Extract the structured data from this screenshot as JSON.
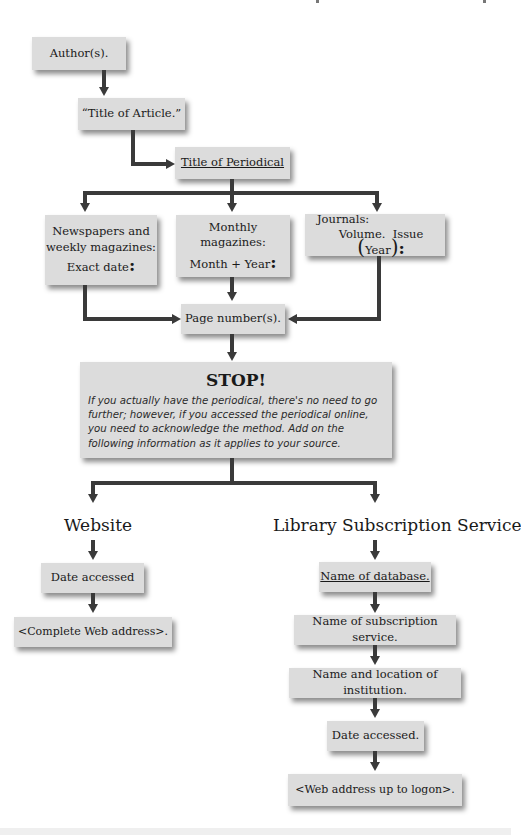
{
  "diagram": {
    "nodes": {
      "author": "Author(s).",
      "article_open": "“",
      "article_text": "Title of Article.",
      "article_close": "”",
      "periodical": "Title of Periodical",
      "newspapers_line1": "Newspapers and",
      "newspapers_line2": "weekly magazines:",
      "newspapers_value": "Exact date",
      "newspapers_colon": ":",
      "monthly_line1": "Monthly magazines:",
      "monthly_value": "Month + Year",
      "monthly_colon": ":",
      "journals_line1": "Journals:",
      "journals_volume": "Volume.",
      "journals_issue": "Issue",
      "journals_paren_open": "(",
      "journals_year": "Year",
      "journals_paren_close": ")",
      "journals_colon": ":",
      "page_numbers": "Page number(s).",
      "stop_title": "STOP!",
      "stop_body": "If you actually have the periodical, there's no need to go further; however, if you accessed the periodical online, you need to acknowledge the method. Add on the following information as it applies to your source."
    },
    "branches": {
      "website": {
        "heading": "Website",
        "steps": [
          "Date accessed",
          "<Complete Web address>."
        ]
      },
      "library": {
        "heading": "Library Subscription Service",
        "steps": [
          "Name of database.",
          "Name of subscription service.",
          "Name and location of institution.",
          "Date accessed.",
          "<Web address up to logon>."
        ]
      }
    },
    "colors": {
      "box": "#dcdcdc",
      "arrow": "#3a3a3a",
      "background": "#ffffff"
    }
  }
}
